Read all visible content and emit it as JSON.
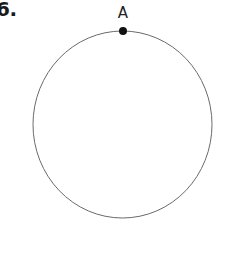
{
  "page": {
    "background_color": "#ffffff",
    "width": 226,
    "height": 270
  },
  "problem": {
    "number_label": "6."
  },
  "figure": {
    "type": "circle-with-marked-point",
    "stroke_color": "#6a6a6a",
    "stroke_width": 1,
    "fill": "none",
    "circle": {
      "center_x": 122.5,
      "center_y": 124.5,
      "radius_x": 89.5,
      "radius_y": 93.5,
      "left": 33,
      "right": 212,
      "top": 31,
      "bottom": 218
    },
    "points": [
      {
        "label": "A",
        "x": 123,
        "y": 31,
        "marker_diameter": 8,
        "marker_color": "#111111",
        "label_color": "#232323",
        "label_position": "above"
      }
    ]
  }
}
